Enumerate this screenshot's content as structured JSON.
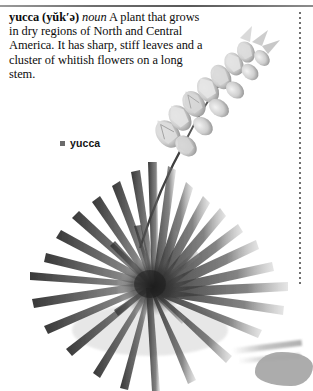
{
  "page": {
    "background_color": "#ffffff",
    "width": 313,
    "height": 391
  },
  "rules": {
    "top_rule_color": "#6e6e6e",
    "dotted_rule_color": "#6f6f6f"
  },
  "entry": {
    "headword": "yucca",
    "pronunciation": "(yŭk′ə)",
    "part_of_speech": "noun",
    "definition": "A plant that grows in dry regions of North and Central America. It has sharp, stiff leaves and a cluster of whitish flowers on a long stem.",
    "lines": [
      "yucca (yŭk′ə) noun A plant that",
      "grows in dry regions of North and",
      "Central America. It has sharp, stiff",
      "leaves and a cluster of whitish",
      "flowers on a long stem."
    ]
  },
  "caption": {
    "bullet": "square-bullet",
    "label": "yucca",
    "bullet_color": "#6b6b6b"
  },
  "illustration": {
    "subject": "yucca-plant-photograph",
    "style": "grayscale",
    "parts": [
      "radial-rosette-of-spiky-leaves",
      "diagonal-flower-stalk",
      "whitish-bell-flowers",
      "ground-shadow"
    ],
    "leaf_color": "#3a3a3a",
    "flower_color": "#c9c9c9",
    "shadow_color": "#a8a8a8"
  }
}
